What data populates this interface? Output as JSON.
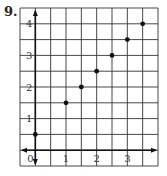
{
  "problem_number": "9.",
  "chart_data": {
    "type": "scatter",
    "title": "",
    "xlabel": "",
    "ylabel": "",
    "x": [
      0,
      1,
      1.5,
      2,
      2.5,
      3,
      3.5
    ],
    "y": [
      0.5,
      1.5,
      2,
      2.5,
      3,
      3.5,
      4
    ],
    "xlim": [
      -0.5,
      4
    ],
    "ylim": [
      -0.5,
      4.5
    ],
    "x_tick_labels": [
      "0",
      "1",
      "2",
      "3"
    ],
    "y_tick_labels": [
      "1",
      "2",
      "3",
      "4"
    ],
    "grid": true,
    "grid_step": 0.5,
    "legend": null
  }
}
